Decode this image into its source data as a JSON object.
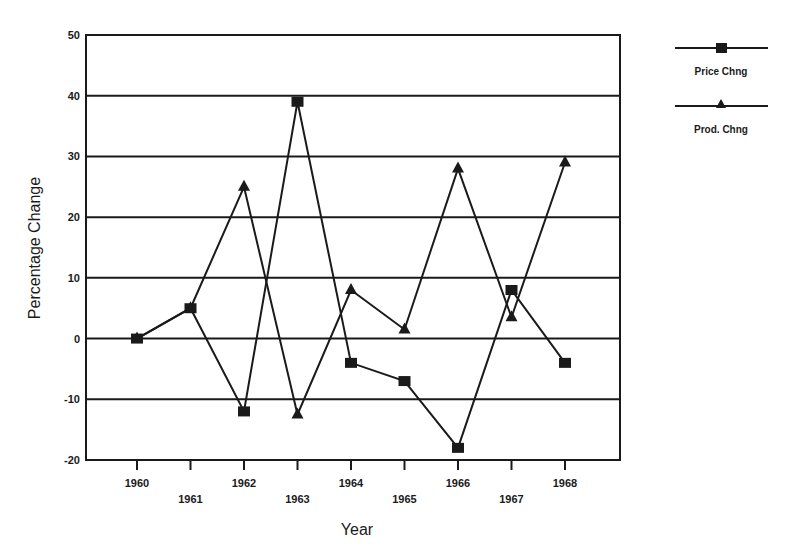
{
  "chart_data": {
    "type": "line",
    "title": "",
    "xlabel": "Year",
    "ylabel": "Percentage Change",
    "categories": [
      "1960",
      "1961",
      "1962",
      "1963",
      "1964",
      "1965",
      "1966",
      "1967",
      "1968"
    ],
    "series": [
      {
        "name": "Price Chng",
        "marker": "square",
        "values": [
          0,
          5,
          -12,
          39,
          -4,
          -7,
          -18,
          8,
          -4
        ]
      },
      {
        "name": "Prod. Chng",
        "marker": "triangle",
        "values": [
          0,
          5,
          25,
          -12.5,
          8,
          1.5,
          28,
          3.5,
          29
        ]
      }
    ],
    "ylim": [
      -20,
      50
    ],
    "yticks": [
      -20,
      -10,
      0,
      10,
      20,
      30,
      40,
      50
    ],
    "grid": true,
    "legend_position": "right-top"
  },
  "legend": {
    "items": [
      {
        "label": "Price Chng",
        "marker": "square"
      },
      {
        "label": "Prod. Chng",
        "marker": "triangle"
      }
    ]
  },
  "colors": {
    "ink": "#1a1a1a",
    "background": "#ffffff"
  }
}
